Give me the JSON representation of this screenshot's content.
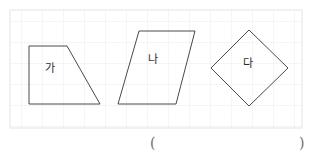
{
  "page": {
    "width": 312,
    "height": 161,
    "background_color": "#ffffff",
    "grid": {
      "visible": true,
      "cell_size": 21,
      "line_color": "#e9e9ec",
      "region": {
        "x": 10,
        "y": 10,
        "width": 292,
        "height": 118
      }
    }
  },
  "figures": [
    {
      "label": "가",
      "shape_type": "trapezoid",
      "stroke_color": "#4a4a4a",
      "points": "29,46 67,46 100,104 29,104",
      "label_position": {
        "x": 45,
        "y": 63
      }
    },
    {
      "label": "나",
      "shape_type": "parallelogram",
      "stroke_color": "#4a4a4a",
      "points": "139,31 195,31 176,104 118,104",
      "label_position": {
        "x": 148,
        "y": 54
      }
    },
    {
      "label": "다",
      "shape_type": "rhombus",
      "stroke_color": "#4a4a4a",
      "points": "249,30 288,68 249,106 211,68",
      "label_position": {
        "x": 243,
        "y": 58
      }
    }
  ],
  "answer_blank": {
    "open_paren": "(",
    "close_paren": ")",
    "open_position": {
      "x": 150,
      "y": 136
    },
    "close_position": {
      "x": 299,
      "y": 136
    },
    "color": "#6d6d6d"
  }
}
